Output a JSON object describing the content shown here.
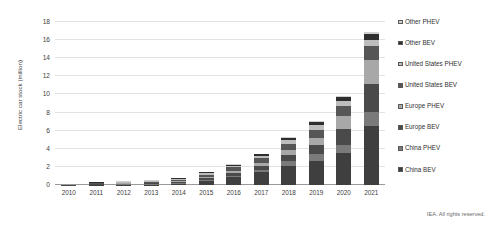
{
  "chart_data": {
    "type": "bar",
    "stacked": true,
    "title": "",
    "subtitle": "",
    "xlabel": "",
    "ylabel": "Electric car stock (million)",
    "ylim": [
      0,
      18
    ],
    "ytick_step": 2,
    "yticks": [
      0,
      2,
      4,
      6,
      8,
      10,
      12,
      14,
      16,
      18
    ],
    "grid": true,
    "legend_position": "right",
    "attribution": "IEA. All rights reserved.",
    "categories": [
      "2010",
      "2011",
      "2012",
      "2013",
      "2014",
      "2015",
      "2016",
      "2017",
      "2018",
      "2019",
      "2020",
      "2021"
    ],
    "series": [
      {
        "name": "China BEV",
        "color": "#3f3f3f",
        "values": [
          0.0,
          0.01,
          0.02,
          0.05,
          0.15,
          0.45,
          0.85,
          1.4,
          2.1,
          2.7,
          3.5,
          6.5
        ]
      },
      {
        "name": "China PHEV",
        "color": "#7a7a7a",
        "values": [
          0.0,
          0.0,
          0.01,
          0.01,
          0.04,
          0.1,
          0.2,
          0.3,
          0.5,
          0.7,
          0.9,
          1.6
        ]
      },
      {
        "name": "Europe BEV",
        "color": "#4a4a4a",
        "values": [
          0.01,
          0.02,
          0.04,
          0.07,
          0.12,
          0.2,
          0.3,
          0.45,
          0.7,
          1.0,
          1.8,
          3.1
        ]
      },
      {
        "name": "Europe PHEV",
        "color": "#a8a8a8",
        "values": [
          0.0,
          0.01,
          0.02,
          0.04,
          0.08,
          0.14,
          0.22,
          0.33,
          0.52,
          0.75,
          1.4,
          2.6
        ]
      },
      {
        "name": "United States BEV",
        "color": "#565656",
        "values": [
          0.0,
          0.02,
          0.05,
          0.11,
          0.18,
          0.27,
          0.37,
          0.5,
          0.75,
          0.97,
          1.15,
          1.5
        ]
      },
      {
        "name": "United States PHEV",
        "color": "#bdbdbd",
        "values": [
          0.0,
          0.01,
          0.03,
          0.06,
          0.1,
          0.15,
          0.2,
          0.28,
          0.4,
          0.5,
          0.56,
          0.7
        ]
      },
      {
        "name": "Other BEV",
        "color": "#2e2e2e",
        "values": [
          0.0,
          0.01,
          0.02,
          0.03,
          0.05,
          0.08,
          0.11,
          0.16,
          0.22,
          0.3,
          0.42,
          0.65
        ]
      },
      {
        "name": "Other PHEV",
        "color": "#d0d0d0",
        "values": [
          0.0,
          0.0,
          0.01,
          0.01,
          0.02,
          0.03,
          0.04,
          0.06,
          0.08,
          0.11,
          0.15,
          0.25
        ]
      }
    ],
    "totals": [
      0.01,
      0.08,
      0.2,
      0.38,
      0.74,
      1.42,
      2.29,
      3.48,
      5.27,
      7.03,
      9.88,
      16.9
    ]
  },
  "legend": {
    "items": [
      {
        "label": "Other PHEV",
        "color": "#d0d0d0"
      },
      {
        "label": "Other BEV",
        "color": "#2e2e2e"
      },
      {
        "label": "United States PHEV",
        "color": "#bdbdbd"
      },
      {
        "label": "United States BEV",
        "color": "#565656"
      },
      {
        "label": "Europe PHEV",
        "color": "#a8a8a8"
      },
      {
        "label": "Europe BEV",
        "color": "#4a4a4a"
      },
      {
        "label": "China PHEV",
        "color": "#7a7a7a"
      },
      {
        "label": "China BEV",
        "color": "#3f3f3f"
      }
    ]
  },
  "footer": {
    "attribution": "IEA. All rights reserved."
  }
}
